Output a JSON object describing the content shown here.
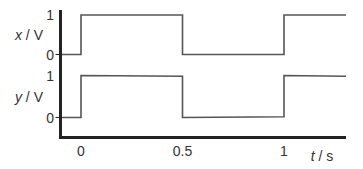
{
  "chart_data": {
    "type": "line",
    "title": "",
    "xlabel": {
      "var": "t",
      "unit": "s"
    },
    "xlim": [
      -0.1,
      1.3
    ],
    "x_ticks": [
      {
        "value": 0,
        "label": "0"
      },
      {
        "value": 0.5,
        "label": "0.5"
      },
      {
        "value": 1,
        "label": "1"
      }
    ],
    "step_style": "square-wave",
    "panels": [
      {
        "name": "x",
        "ylabel": {
          "var": "x",
          "unit": "V"
        },
        "ylim": [
          0,
          1
        ],
        "y_ticks": [
          {
            "value": 1,
            "label": "1"
          },
          {
            "value": 0,
            "label": "0"
          }
        ],
        "points": [
          [
            -0.1,
            0
          ],
          [
            0,
            0
          ],
          [
            0,
            1
          ],
          [
            0.5,
            1
          ],
          [
            0.5,
            0
          ],
          [
            1,
            0
          ],
          [
            1,
            1
          ],
          [
            1.3,
            1
          ]
        ]
      },
      {
        "name": "y",
        "ylabel": {
          "var": "y",
          "unit": "V"
        },
        "ylim": [
          0,
          1
        ],
        "y_ticks": [
          {
            "value": 1,
            "label": "1"
          },
          {
            "value": 0,
            "label": "0"
          }
        ],
        "points": [
          [
            -0.1,
            0
          ],
          [
            0,
            0
          ],
          [
            0,
            1
          ],
          [
            0.5,
            0.98
          ],
          [
            0.5,
            0
          ],
          [
            1,
            0.02
          ],
          [
            1,
            1
          ],
          [
            1.3,
            0.98
          ]
        ]
      }
    ],
    "colors": {
      "axis": "#222222",
      "signal": "#555555",
      "text": "#333333"
    },
    "grid": false,
    "legend": "none"
  }
}
